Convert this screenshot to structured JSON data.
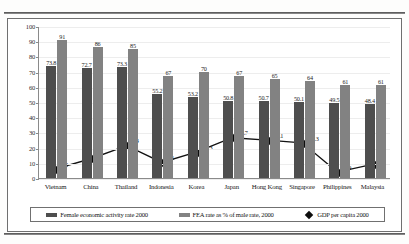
{
  "chart_data": {
    "type": "bar",
    "title": "",
    "xlabel": "",
    "ylabel": "",
    "ylim": [
      0,
      100
    ],
    "ytick_step": 10,
    "yticks": [
      0,
      10,
      20,
      30,
      40,
      50,
      60,
      70,
      80,
      90,
      100
    ],
    "grid": true,
    "legend_position": "bottom",
    "categories": [
      "Vietnam",
      "China",
      "Thailand",
      "Indonesia",
      "Korea",
      "Japan",
      "Hong Kong",
      "Singapore",
      "Philippines",
      "Malaysia"
    ],
    "series": [
      {
        "name": "Female economic activity rate 2000",
        "type": "bar",
        "color": "#4e4e4e",
        "values": [
          73.8,
          72.7,
          73.3,
          55.2,
          53.2,
          50.8,
          50.7,
          50.1,
          49.5,
          48.4
        ],
        "labels": [
          "73.8",
          "72.7",
          "73.3",
          "55.2",
          "53.2",
          "50.8",
          "50.7",
          "50.1",
          "49.5",
          "48.4"
        ]
      },
      {
        "name": "FEA rate as % of male rate, 2000",
        "type": "bar",
        "color": "#828282",
        "values": [
          91,
          86,
          85,
          67,
          70,
          67,
          65,
          64,
          61,
          61
        ],
        "labels": [
          "91",
          "86",
          "85",
          "67",
          "70",
          "67",
          "65",
          "64",
          "61",
          "61"
        ]
      },
      {
        "name": "GDP per capita 2000",
        "type": "line",
        "color": "#0d0d0d",
        "marker": "diamond",
        "values": [
          6.2,
          12.9,
          21.4,
          10.3,
          17.3,
          26.7,
          25.1,
          23.3,
          3.9,
          9.0
        ],
        "labels": [
          "6.2",
          "19",
          "6.4",
          "3.1",
          "17.3",
          "26.7",
          "25.1",
          "23.3",
          "3.9",
          "9"
        ]
      }
    ]
  },
  "legend": {
    "items": [
      {
        "label": "Female economic activity rate 2000",
        "swatch": "bar-dark-swatch"
      },
      {
        "label": "FEA rate as % of male rate, 2000",
        "swatch": "bar-light-swatch"
      },
      {
        "label": "GDP per capita 2000",
        "swatch": "diamond-marker-swatch"
      }
    ]
  }
}
